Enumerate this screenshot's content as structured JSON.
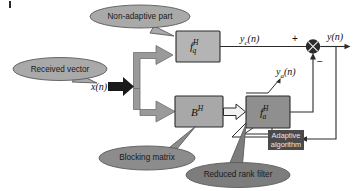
{
  "diagram": {
    "blocks": [
      {
        "name": "non-adaptive-filter-block",
        "label_main": "f",
        "label_sub": "q",
        "label_sup": "H",
        "fill": "#b4b4b4",
        "stroke": "#2b2b2b"
      },
      {
        "name": "blocking-matrix-block",
        "label_main": "B",
        "label_sub": "",
        "label_sup": "H",
        "fill": "#a8a8a8",
        "stroke": "#2b2b2b"
      },
      {
        "name": "adaptive-filter-block",
        "label_main": "f",
        "label_sub": "a",
        "label_sup": "H",
        "fill": "#8f8f8f",
        "stroke": "#2b2b2b"
      }
    ],
    "adaptive_algorithm_box": {
      "line1": "Adaptive",
      "line2": "algorithm",
      "fill": "#4a4a4a",
      "text_color": "#e8e8e8"
    },
    "signals": {
      "input": "x(n)",
      "input_var": "x",
      "input_arg": "(n)",
      "non_adaptive_output": "y",
      "non_adaptive_output_sub": "c",
      "non_adaptive_output_arg": "(n)",
      "adaptive_output": "y",
      "adaptive_output_sub": "a",
      "adaptive_output_arg": "(n)",
      "final_output": "y",
      "final_output_arg": "(n)"
    },
    "sum_node": {
      "name": "summing-junction",
      "plus_sign": "+",
      "minus_sign": "−",
      "fill": "#2b2b2b"
    },
    "callouts": [
      {
        "name": "callout-non-adaptive-part",
        "text": "Non-adaptive part",
        "fill": "#a9a9a9",
        "stroke": "#5a5a5a"
      },
      {
        "name": "callout-received-vector",
        "text": "Received vector",
        "fill": "#a9a9a9",
        "stroke": "#5a5a5a"
      },
      {
        "name": "callout-blocking-matrix",
        "text": "Blocking matrix",
        "fill": "#8c8c8c",
        "stroke": "#5a5a5a"
      },
      {
        "name": "callout-reduced-rank-filter",
        "text": "Reduced rank filter",
        "fill": "#7d7d7d",
        "stroke": "#5a5a5a"
      }
    ],
    "colors": {
      "background": "#ffffff",
      "line": "#2b2b2b",
      "thick_arrow_fill": "#9a9a9a",
      "black_arrow_fill": "#1a1a1a",
      "hollow_arrow_fill": "#f2f2f2"
    }
  }
}
